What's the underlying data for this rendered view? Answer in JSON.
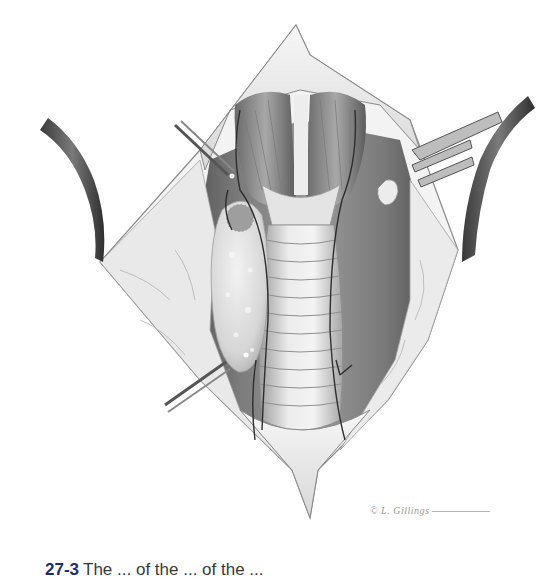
{
  "figure": {
    "elements": {
      "upper_flap": "skin-flap-superior",
      "lower_flap": "skin-flap-inferior",
      "strap_muscles": "strap-muscles",
      "trachea": "trachea",
      "gland": "enlarged-gland",
      "left_retractor": "retractor-left",
      "right_retractor": "retractor-right",
      "upper_clamp": "forceps-upper-left",
      "lower_clamp": "forceps-lower-left",
      "right_rake": "rake-retractor-right",
      "small_gland": "small-gland-right"
    },
    "colors": {
      "tissue_dark": "#5a5a5a",
      "tissue_mid": "#8c8c8c",
      "tissue_light": "#d9d9d9",
      "fat": "#ececec",
      "outline": "#6e6e6e"
    }
  },
  "signature": {
    "text": "© L. Gillings"
  },
  "caption": {
    "figure_number": "27-3",
    "text": "The ... of the ... of the ..."
  }
}
